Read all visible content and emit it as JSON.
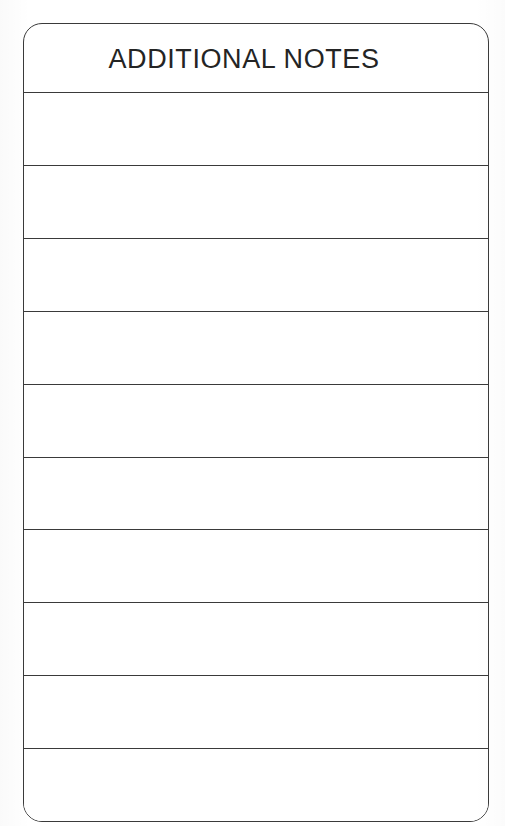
{
  "document": {
    "kind": "scanned-form",
    "title": "ADDITIONAL NOTES",
    "page_background": "#ffffff",
    "ink_color": "#3a3a3a",
    "text_color": "#242424"
  },
  "form": {
    "header": {
      "label": "ADDITIONAL NOTES"
    },
    "rows": [
      {
        "value": ""
      },
      {
        "value": ""
      },
      {
        "value": ""
      },
      {
        "value": ""
      },
      {
        "value": ""
      },
      {
        "value": ""
      },
      {
        "value": ""
      },
      {
        "value": ""
      },
      {
        "value": ""
      },
      {
        "value": ""
      }
    ]
  }
}
